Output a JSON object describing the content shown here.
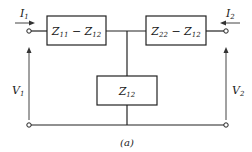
{
  "diagram": {
    "caption": "(a)",
    "type": "two-port T-equivalent network",
    "boxes": {
      "series_left": {
        "main": "Z",
        "sub_a": "11",
        "minus": " − ",
        "main2": "Z",
        "sub_b": "12"
      },
      "series_right": {
        "main": "Z",
        "sub_a": "22",
        "minus": " − ",
        "main2": "Z",
        "sub_b": "12"
      },
      "shunt": {
        "main": "Z",
        "sub": "12"
      }
    },
    "labels": {
      "I1": {
        "main": "I",
        "sub": "1"
      },
      "I2": {
        "main": "I",
        "sub": "2"
      },
      "V1": {
        "main": "V",
        "sub": "1"
      },
      "V2": {
        "main": "V",
        "sub": "2"
      }
    }
  }
}
